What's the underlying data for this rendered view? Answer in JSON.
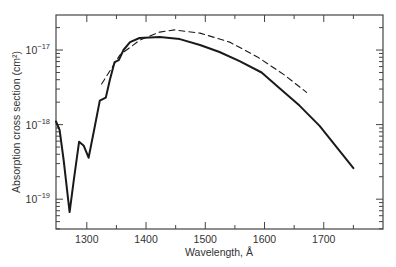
{
  "chart_data": {
    "type": "line",
    "title": "",
    "xlabel": "Wavelength, Å",
    "ylabel": "Absorption cross section (cm²)",
    "yscale": "log",
    "xlim": [
      1248,
      1800
    ],
    "ylim_log10": [
      -19.4,
      -16.53
    ],
    "x_ticks": [
      1300,
      1400,
      1500,
      1600,
      1700
    ],
    "x_minor_ticks": [
      1350,
      1450,
      1550,
      1650,
      1750
    ],
    "y_ticks": [
      {
        "exp": -17,
        "label_base": "10",
        "label_exp": "−17"
      },
      {
        "exp": -18,
        "label_base": "10",
        "label_exp": "−18"
      },
      {
        "exp": -19,
        "label_base": "10",
        "label_exp": "−19"
      }
    ],
    "grid": false,
    "series": [
      {
        "name": "measured",
        "style": "solid",
        "x": [
          1248,
          1254,
          1261,
          1271,
          1278,
          1287,
          1295,
          1303,
          1313,
          1322,
          1332,
          1339,
          1347,
          1354,
          1362,
          1373,
          1389,
          1423,
          1457,
          1491,
          1524,
          1558,
          1595,
          1625,
          1659,
          1693,
          1727,
          1750
        ],
        "y": [
          1.1e-18,
          8.5e-19,
          3.3e-19,
          6.7e-20,
          1.8e-19,
          5.9e-19,
          5.2e-19,
          3.6e-19,
          9e-19,
          2.1e-18,
          2.3e-18,
          4e-18,
          6.9e-18,
          7.3e-18,
          1e-17,
          1.28e-17,
          1.45e-17,
          1.49e-17,
          1.4e-17,
          1.17e-17,
          9.4e-18,
          7.1e-18,
          5e-18,
          3.1e-18,
          1.8e-18,
          9.6e-19,
          4.4e-19,
          2.6e-19
        ]
      },
      {
        "name": "calculated",
        "style": "dashed",
        "x": [
          1325,
          1356,
          1389,
          1423,
          1448,
          1491,
          1541,
          1588,
          1634,
          1671
        ],
        "y": [
          3.5e-18,
          8.6e-18,
          1.35e-17,
          1.74e-17,
          1.86e-17,
          1.69e-17,
          1.28e-17,
          8.1e-18,
          4.6e-18,
          2.7e-18
        ]
      }
    ]
  }
}
